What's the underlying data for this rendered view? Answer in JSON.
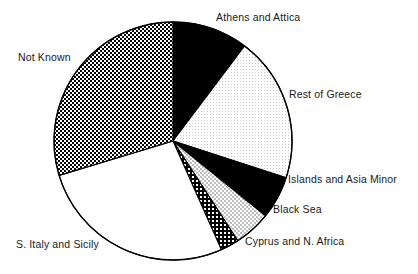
{
  "figure": {
    "background_color": "#ffffff",
    "outline_color": "#000000"
  },
  "chart_data": {
    "type": "pie",
    "title": "",
    "subtitle": "",
    "xlabel": "",
    "ylabel": "",
    "grid": false,
    "legend_position": "none",
    "labels_position": "outside",
    "center": {
      "x": 173,
      "y": 141
    },
    "radius": 119,
    "start_angle_deg": 0,
    "direction": "clockwise",
    "categories": [
      "Athens and Attica",
      "Rest of Greece",
      "Islands and Asia Minor",
      "Black Sea",
      "Cyprus and N. Africa",
      "S. Italy and Sicily",
      "Not Known"
    ],
    "values": [
      10.3,
      19.7,
      5.8,
      5.0,
      2.5,
      27.0,
      29.7
    ],
    "value_unit": "percent",
    "slices": [
      {
        "label": "Athens and Attica",
        "value": 10.3,
        "start_deg": 0.0,
        "end_deg": 37.0,
        "fill": "solid-black",
        "fill_color": "#000000"
      },
      {
        "label": "Rest of Greece",
        "value": 19.7,
        "start_deg": 37.0,
        "end_deg": 108.0,
        "fill": "fine-stipple-light",
        "fill_color": "#f0f0f0"
      },
      {
        "label": "Islands and Asia Minor",
        "value": 5.8,
        "start_deg": 108.0,
        "end_deg": 129.0,
        "fill": "solid-black",
        "fill_color": "#111111"
      },
      {
        "label": "Black Sea",
        "value": 5.0,
        "start_deg": 129.0,
        "end_deg": 147.0,
        "fill": "checker-light",
        "fill_color": "#dcdcdc"
      },
      {
        "label": "Cyprus and N. Africa",
        "value": 2.5,
        "start_deg": 147.0,
        "end_deg": 156.0,
        "fill": "checker-dark",
        "fill_color": "#3a3a3a"
      },
      {
        "label": "S. Italy and Sicily",
        "value": 27.0,
        "start_deg": 156.0,
        "end_deg": 253.2,
        "fill": "white",
        "fill_color": "#ffffff"
      },
      {
        "label": "Not Known",
        "value": 29.7,
        "start_deg": 253.2,
        "end_deg": 360.0,
        "fill": "checker-dense",
        "fill_color": "#555555"
      }
    ]
  },
  "labels": {
    "athens": "Athens and Attica",
    "rest_of_greece": "Rest of Greece",
    "islands": "Islands and Asia Minor",
    "black_sea": "Black Sea",
    "cyprus": "Cyprus and N. Africa",
    "s_italy": "S. Italy and Sicily",
    "not_known": "Not Known"
  }
}
